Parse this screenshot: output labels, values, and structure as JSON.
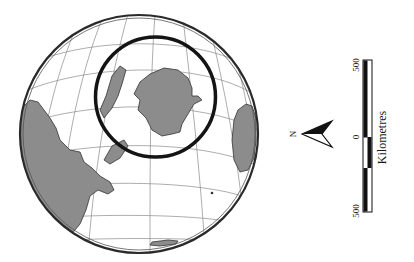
{
  "map": {
    "projection": "orthographic globe",
    "land_color": "#8c8c8c",
    "ocean_color": "#ffffff",
    "graticule_color": "#7a7a7a",
    "outline_color": "#2a2a2a",
    "highlight_circle_color": "#141414"
  },
  "north_arrow": {
    "label": "N"
  },
  "scale_bar": {
    "left_label": "500",
    "middle_label": "0",
    "right_label": "500",
    "unit": "Kilometres"
  }
}
